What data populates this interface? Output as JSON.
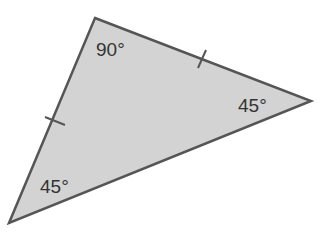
{
  "figure": {
    "type": "triangle",
    "fill_color": "#d3d3d3",
    "stroke_color": "#555555",
    "vertices": {
      "top": [
        95,
        18
      ],
      "right": [
        311,
        101
      ],
      "bottom_left": [
        9,
        223
      ]
    },
    "angles": [
      {
        "vertex": "top",
        "label": "90°"
      },
      {
        "vertex": "right",
        "label": "45°"
      },
      {
        "vertex": "bottom_left",
        "label": "45°"
      }
    ],
    "congruence_marks": [
      {
        "side": "top-right",
        "count": 1
      },
      {
        "side": "top-bottom_left",
        "count": 1
      }
    ]
  }
}
